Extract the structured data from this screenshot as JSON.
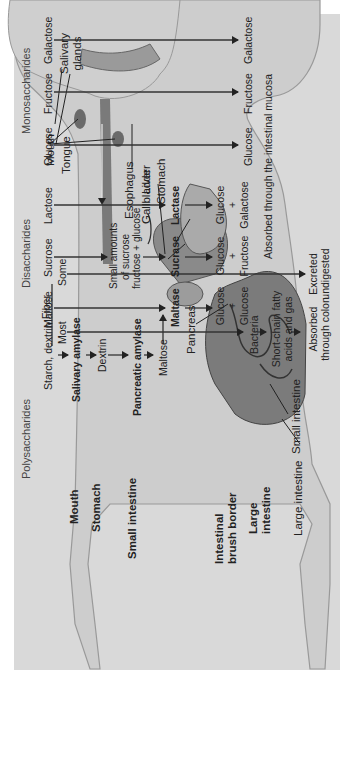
{
  "sections": {
    "polysaccharides": "Polysaccharides",
    "disaccharides": "Disaccharides",
    "monosaccharides": "Monosaccharides"
  },
  "sources": {
    "fiber": "Fiber",
    "some": "Some",
    "most": "Most",
    "starch": "Starch, dextrin",
    "maltose": "Maltose",
    "sucrose": "Sucrose",
    "lactose": "Lactose",
    "glucose": "Glucose",
    "fructose": "Fructose",
    "galactose": "Galactose"
  },
  "starch_path": {
    "salivary_amylase": "Salivary amylase",
    "dextrin": "Dextrin",
    "pancreatic_amylase": "Pancreatic amylase",
    "maltose": "Maltose"
  },
  "sucrose_note": {
    "line1": "Small amounts",
    "line2": "of sucrose",
    "line3": "fructose + glucose"
  },
  "enzymes": {
    "maltase": "Maltase",
    "sucrase": "Sucrase",
    "lactase": "Lactase"
  },
  "products": {
    "maltase": {
      "a": "Glucose",
      "plus": "+",
      "b": "Glucose"
    },
    "sucrase": {
      "a": "Glucose",
      "plus": "+",
      "b": "Fructose"
    },
    "lactase": {
      "a": "Glucose",
      "plus": "+",
      "b": "Galactose"
    },
    "glucose": "Glucose",
    "fructose": "Fructose",
    "galactose": "Galactose"
  },
  "fiber_path": {
    "bacteria": "Bacteria",
    "scfa_line1": "Short-chain fatty",
    "scfa_line2": "acids and gas",
    "absorbed_line1": "Absorbed",
    "absorbed_line2": "through colon",
    "excreted_line1": "Excreted",
    "excreted_line2": "undigested"
  },
  "absorption_note": "Absorbed through the intestinal mucosa",
  "sites": {
    "mouth": "Mouth",
    "stomach": "Stomach",
    "small_intestine": "Small intestine",
    "brush_border_line1": "Intestinal",
    "brush_border_line2": "brush border",
    "large_intestine_line1": "Large",
    "large_intestine_line2": "intestine"
  },
  "anatomy": {
    "mouth": "Mouth",
    "tongue": "Tongue",
    "salivary_line1": "Salivary",
    "salivary_line2": "glands",
    "esophagus": "Esophagus",
    "gallbladder": "Gallbladder",
    "liver": "Liver",
    "stomach": "Stomach",
    "pancreas": "Pancreas",
    "small_intestine": "Small intestine",
    "large_intestine": "Large intestine"
  },
  "colors": {
    "panel": "#d9d9d9",
    "body": "#cfcfcf",
    "organ": "#7a7a7a",
    "text": "#222222"
  }
}
